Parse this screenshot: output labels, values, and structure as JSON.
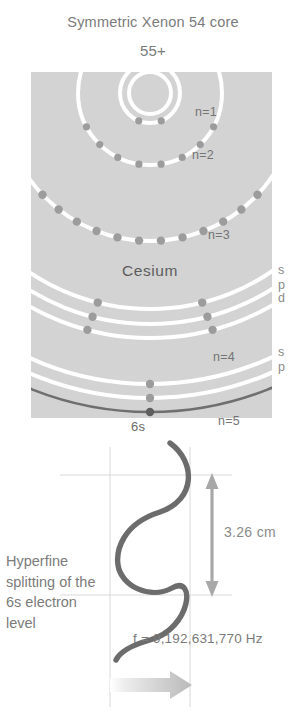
{
  "figure": {
    "title": "Symmetric Xenon 54 core",
    "charge": "55+",
    "element": "Cesium"
  },
  "atom": {
    "shell_labels": [
      {
        "text": "n=1",
        "x": 195,
        "y": 105
      },
      {
        "text": "n=2",
        "x": 192,
        "y": 148
      },
      {
        "text": "n=3",
        "x": 208,
        "y": 228
      },
      {
        "text": "n=4",
        "x": 213,
        "y": 350
      },
      {
        "text": "n=5",
        "x": 218,
        "y": 414
      }
    ],
    "subshell_labels": [
      {
        "text": "s",
        "x": 278,
        "y": 263
      },
      {
        "text": "p",
        "x": 278,
        "y": 278
      },
      {
        "text": "d",
        "x": 278,
        "y": 291
      },
      {
        "text": "s",
        "x": 278,
        "y": 345
      },
      {
        "text": "p",
        "x": 278,
        "y": 360
      }
    ],
    "valence_label": "6s"
  },
  "wave": {
    "dimension": "3.26 cm",
    "caption": "Hyperfine splitting of the 6s electron level",
    "frequency": "f = 9,192,631,770 Hz"
  },
  "colors": {
    "panel": "#d2d2d2",
    "shell_line": "#ffffff",
    "electron": "#9b9b9b",
    "outer_shell": "#6b6b6b",
    "wave": "#6b6b6b",
    "text": "#6f6f6f",
    "guide": "#cfcfcf"
  },
  "chart_data": {
    "type": "diagram",
    "shells": [
      {
        "n": 1,
        "radius": 30,
        "electrons": 2
      },
      {
        "n": 2,
        "radius": 72,
        "electrons": 8
      },
      {
        "n": 3,
        "radius": 148,
        "electrons": 18
      },
      {
        "n": 4,
        "radius": 250,
        "electrons": 18
      },
      {
        "n": 5,
        "radius": 320,
        "electrons": 8
      },
      {
        "n": 6,
        "radius": 352,
        "electrons": 1
      }
    ],
    "subshells": [
      "s",
      "p",
      "d",
      "s",
      "p"
    ],
    "wavelength_cm": 3.26,
    "frequency_hz": 9192631770
  }
}
